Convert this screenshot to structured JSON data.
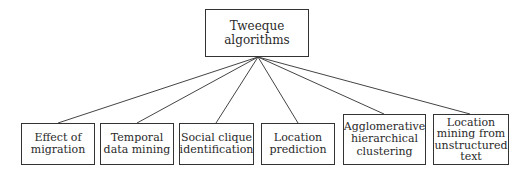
{
  "diagram": {
    "root": {
      "label": "Tweeque\nalgorithms"
    },
    "children": [
      {
        "label": "Effect of\nmigration"
      },
      {
        "label": "Temporal\ndata mining"
      },
      {
        "label": "Social clique\nidentification"
      },
      {
        "label": "Location\nprediction"
      },
      {
        "label": "Agglomerative\nhierarchical\nclustering"
      },
      {
        "label": "Location\nmining from\nunstructured\ntext"
      }
    ]
  }
}
